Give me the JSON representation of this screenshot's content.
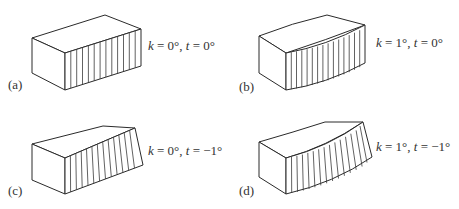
{
  "figure": {
    "stroke_color": "#2a2a2a",
    "background": "#ffffff",
    "panels": [
      {
        "id": "a",
        "tag": "(a)",
        "k_var": "k",
        "k_val": " = 0°, ",
        "t_var": "t",
        "t_val": " = 0°",
        "k": 0,
        "t": 0
      },
      {
        "id": "b",
        "tag": "(b)",
        "k_var": "k",
        "k_val": " = 1°, ",
        "t_var": "t",
        "t_val": " = 0°",
        "k": 1,
        "t": 0
      },
      {
        "id": "c",
        "tag": "(c)",
        "k_var": "k",
        "k_val": " = 0°, ",
        "t_var": "t",
        "t_val": " = −1°",
        "k": 0,
        "t": -1
      },
      {
        "id": "d",
        "tag": "(d)",
        "k_var": "k",
        "k_val": " = 1°, ",
        "t_var": "t",
        "t_val": " = −1°",
        "k": 1,
        "t": -1
      }
    ]
  }
}
